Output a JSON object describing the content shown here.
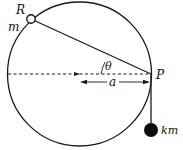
{
  "diagram": {
    "labels": {
      "ring": "R",
      "ring_mass": "m",
      "angle": "θ",
      "point": "P",
      "radius": "a",
      "hanging_mass": "km"
    },
    "colors": {
      "stroke": "#1a1a1a",
      "background": "#ffffff"
    }
  }
}
